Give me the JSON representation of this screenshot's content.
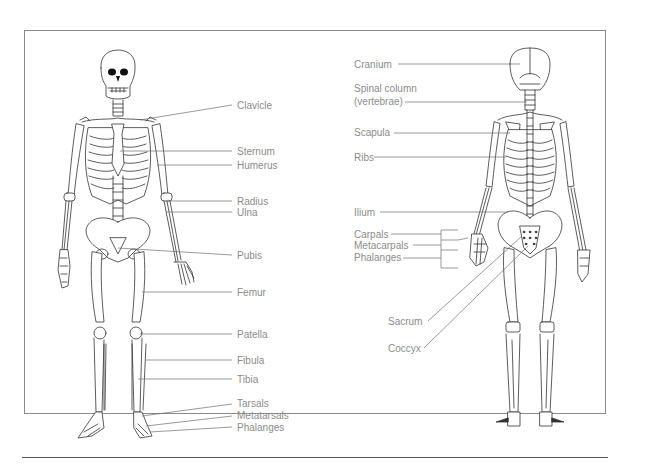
{
  "diagram": {
    "colors": {
      "label_text": "#8c8c8c",
      "leader_line": "#6e6e6e",
      "frame": "#8a8a8a",
      "bone_outline": "#333333"
    },
    "anterior_view": {
      "labels": [
        {
          "id": "clavicle",
          "text": "Clavicle"
        },
        {
          "id": "sternum",
          "text": "Sternum"
        },
        {
          "id": "humerus",
          "text": "Humerus"
        },
        {
          "id": "radius",
          "text": "Radius"
        },
        {
          "id": "ulna",
          "text": "Ulna"
        },
        {
          "id": "pubis",
          "text": "Pubis"
        },
        {
          "id": "femur",
          "text": "Femur"
        },
        {
          "id": "patella",
          "text": "Patella"
        },
        {
          "id": "fibula",
          "text": "Fibula"
        },
        {
          "id": "tibia",
          "text": "Tibia"
        },
        {
          "id": "tarsals",
          "text": "Tarsals"
        },
        {
          "id": "metatarsals",
          "text": "Metatarsals"
        },
        {
          "id": "phalanges",
          "text": "Phalanges"
        }
      ]
    },
    "posterior_view": {
      "labels": [
        {
          "id": "cranium",
          "text": "Cranium"
        },
        {
          "id": "spinal-column",
          "text": "Spinal column"
        },
        {
          "id": "vertebrae",
          "text": "(vertebrae)"
        },
        {
          "id": "scapula",
          "text": "Scapula"
        },
        {
          "id": "ribs",
          "text": "Ribs"
        },
        {
          "id": "ilium",
          "text": "Ilium"
        },
        {
          "id": "carpals",
          "text": "Carpals"
        },
        {
          "id": "metacarpals",
          "text": "Metacarpals"
        },
        {
          "id": "phalanges",
          "text": "Phalanges"
        },
        {
          "id": "sacrum",
          "text": "Sacrum"
        },
        {
          "id": "coccyx",
          "text": "Coccyx"
        }
      ]
    }
  }
}
